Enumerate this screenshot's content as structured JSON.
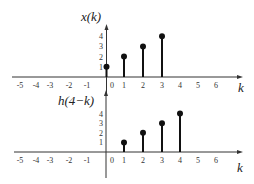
{
  "chart_data": [
    {
      "type": "stem",
      "title": "x(k)",
      "xlabel": "k",
      "ylabel": "",
      "x_ticks": [
        -5,
        -4,
        -3,
        -2,
        -1,
        0,
        1,
        2,
        3,
        4,
        5,
        6
      ],
      "y_ticks": [
        1,
        2,
        3,
        4
      ],
      "x": [
        0,
        1,
        2,
        3
      ],
      "values": [
        1,
        2,
        3,
        4
      ],
      "grid": false
    },
    {
      "type": "stem",
      "title": "h(4−k)",
      "xlabel": "k",
      "ylabel": "",
      "x_ticks": [
        -5,
        -4,
        -3,
        -2,
        -1,
        0,
        1,
        2,
        3,
        4,
        5,
        6
      ],
      "y_ticks": [
        1,
        2,
        3,
        4
      ],
      "x": [
        1,
        2,
        3,
        4
      ],
      "values": [
        1,
        2,
        3,
        4
      ],
      "grid": false
    }
  ],
  "colors": {
    "stem": "#111111",
    "axis": "#333333",
    "text": "#222222"
  }
}
